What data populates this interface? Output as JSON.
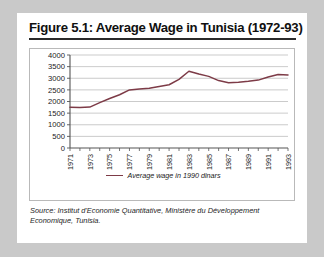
{
  "figure": {
    "title": "Figure 5.1: Average Wage in Tunisia (1972-93)",
    "source": "Source: Institut d'Economie Quantitative, Ministère du Développement Economique, Tunisia."
  },
  "chart_data": {
    "type": "line",
    "title": "Figure 5.1: Average Wage in Tunisia (1972-93)",
    "xlabel": "",
    "ylabel": "",
    "ylim": [
      0,
      4000
    ],
    "xlim": [
      1971,
      1993
    ],
    "yticks": [
      0,
      500,
      1000,
      1500,
      2000,
      2500,
      3000,
      3500,
      4000
    ],
    "ytick_labels": [
      "0",
      "500",
      "1000",
      "1500",
      "2000",
      "2500",
      "3000",
      "3500",
      "4000"
    ],
    "xticks": [
      1971,
      1973,
      1975,
      1977,
      1979,
      1981,
      1983,
      1985,
      1987,
      1989,
      1991,
      1993
    ],
    "xtick_labels": [
      "1971",
      "1973",
      "1975",
      "1977",
      "1979",
      "1981",
      "1983",
      "1985",
      "1987",
      "1989",
      "1991",
      "1993"
    ],
    "xtick_rotation": 90,
    "grid": "horizontal",
    "legend_position": "bottom",
    "line_color": "#7d3b47",
    "series": [
      {
        "name": "Average wage in 1990 dinars",
        "x": [
          1971,
          1972,
          1973,
          1974,
          1975,
          1976,
          1977,
          1978,
          1979,
          1980,
          1981,
          1982,
          1983,
          1984,
          1985,
          1986,
          1987,
          1988,
          1989,
          1990,
          1991,
          1992,
          1993
        ],
        "values": [
          1750,
          1740,
          1760,
          1950,
          2130,
          2290,
          2500,
          2540,
          2570,
          2650,
          2720,
          2950,
          3300,
          3180,
          3080,
          2900,
          2810,
          2830,
          2870,
          2920,
          3050,
          3160,
          3140
        ]
      }
    ]
  },
  "legend": {
    "entry_label": "Average wage in 1990 dinars"
  }
}
